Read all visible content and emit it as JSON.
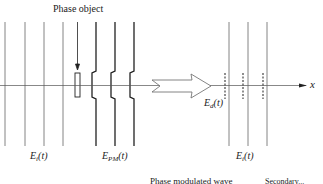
{
  "diagram": {
    "labels": {
      "phase_object": "Phase object",
      "incident_wave_left": {
        "base": "E",
        "sub": "i",
        "arg": "(t)"
      },
      "phase_modulated_wave": {
        "base": "E",
        "sub": "PM",
        "arg": "(t)"
      },
      "diffracted_wave": {
        "base": "E",
        "sub": "d",
        "arg": "(t)"
      },
      "incident_wave_right": {
        "base": "E",
        "sub": "i",
        "arg": "(t)"
      },
      "axis": "x",
      "caption_left": "Phase modulated wave",
      "caption_right": "Secondary..."
    },
    "colors": {
      "line": "#555555",
      "thick_line": "#222222",
      "axis": "#444444"
    },
    "planes": {
      "incident_left_x": [
        5,
        25,
        44,
        63
      ],
      "phase_modulated_x": [
        96,
        115,
        134
      ],
      "incident_right_x": [
        229,
        248,
        267
      ],
      "diffracted_dashed_x": [
        225,
        243,
        263
      ]
    }
  }
}
